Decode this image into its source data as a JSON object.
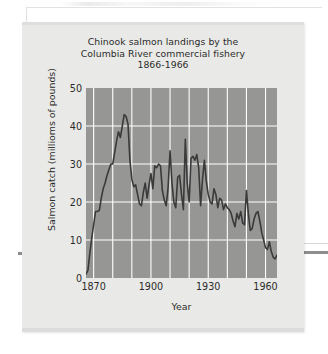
{
  "figure": {
    "title_lines": [
      "Chinook salmon landings by the",
      "Columbia River commercial fishery",
      "1866-1966"
    ]
  },
  "colors": {
    "page_background": "#ffffff",
    "panel_background": "#e9e9e7",
    "plot_background": "#969695",
    "gridline": "#ffffff",
    "series_line": "#3a3a3a",
    "text": "#2b2b2b"
  },
  "chart_data": {
    "type": "line",
    "title": "Chinook salmon landings by the Columbia River commercial fishery 1866-1966",
    "xlabel": "Year",
    "ylabel": "Salmon catch (millioms of pounds)",
    "xlim": [
      1866,
      1966
    ],
    "ylim": [
      0,
      50
    ],
    "xticks": [
      1870,
      1900,
      1930,
      1960
    ],
    "xtick_labels": [
      "1870",
      "1900",
      "1930",
      "1960"
    ],
    "yticks": [
      0,
      10,
      20,
      30,
      40,
      50
    ],
    "ytick_labels": [
      "0",
      "10",
      "20",
      "30",
      "40",
      "50"
    ],
    "gridlines": {
      "vertical_every_years": 10,
      "vertical_values": [
        1870,
        1880,
        1890,
        1900,
        1910,
        1920,
        1930,
        1940,
        1950,
        1960
      ],
      "horizontal_values": [
        10,
        20,
        30,
        40
      ],
      "visible": true
    },
    "legend": null,
    "series": [
      {
        "name": "Chinook salmon landings",
        "x": [
          1866,
          1867,
          1868,
          1869,
          1870,
          1871,
          1872,
          1873,
          1874,
          1875,
          1876,
          1877,
          1878,
          1879,
          1880,
          1881,
          1882,
          1883,
          1884,
          1885,
          1886,
          1887,
          1888,
          1889,
          1890,
          1891,
          1892,
          1893,
          1894,
          1895,
          1896,
          1897,
          1898,
          1899,
          1900,
          1901,
          1902,
          1903,
          1904,
          1905,
          1906,
          1907,
          1908,
          1909,
          1910,
          1911,
          1912,
          1913,
          1914,
          1915,
          1916,
          1917,
          1918,
          1919,
          1920,
          1921,
          1922,
          1923,
          1924,
          1925,
          1926,
          1927,
          1928,
          1929,
          1930,
          1931,
          1932,
          1933,
          1934,
          1935,
          1936,
          1937,
          1938,
          1939,
          1940,
          1941,
          1942,
          1943,
          1944,
          1945,
          1946,
          1947,
          1948,
          1949,
          1950,
          1951,
          1952,
          1953,
          1954,
          1955,
          1956,
          1957,
          1958,
          1959,
          1960,
          1961,
          1962,
          1963,
          1964,
          1965,
          1966
        ],
        "values": [
          1.0,
          2.0,
          6.5,
          10.5,
          14.0,
          17.5,
          17.5,
          17.8,
          21.0,
          23.5,
          25.0,
          27.0,
          28.5,
          30.0,
          30.0,
          33.0,
          36.0,
          38.5,
          37.0,
          40.0,
          43.0,
          42.5,
          40.5,
          31.0,
          26.0,
          24.0,
          24.5,
          22.0,
          19.5,
          19.0,
          22.5,
          25.0,
          21.0,
          24.5,
          27.5,
          23.5,
          29.5,
          29.0,
          30.0,
          29.5,
          23.0,
          20.5,
          19.0,
          24.0,
          33.5,
          25.0,
          20.0,
          18.5,
          26.5,
          27.0,
          22.0,
          18.0,
          36.5,
          25.0,
          20.0,
          31.5,
          32.0,
          31.0,
          32.5,
          29.0,
          19.0,
          26.0,
          31.0,
          25.5,
          22.0,
          20.0,
          19.5,
          23.5,
          22.0,
          18.5,
          21.0,
          20.5,
          18.0,
          19.5,
          18.5,
          18.0,
          17.0,
          15.0,
          13.5,
          17.0,
          15.5,
          17.5,
          14.5,
          14.0,
          23.0,
          17.0,
          12.5,
          13.0,
          15.5,
          17.0,
          17.5,
          15.0,
          12.0,
          10.0,
          8.0,
          7.5,
          9.5,
          7.0,
          5.5,
          5.0,
          6.0
        ]
      }
    ],
    "notes": [
      "Series peaks at about 43 million pounds in 1886.",
      "Series begins near 1 million pounds in 1866 and ends near 6 million pounds in 1966."
    ]
  },
  "axis_titles": {
    "y": "Salmon catch (millioms of pounds)",
    "x": "Year"
  }
}
